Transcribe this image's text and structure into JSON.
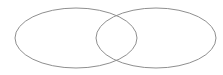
{
  "diagram": {
    "type": "venn",
    "background": "#ffffff",
    "stroke_color": "#8f8f8f",
    "stroke_width": 1,
    "shapes": [
      {
        "name": "left-ellipse",
        "cx": 76,
        "cy": 38,
        "rx": 61,
        "ry": 30
      },
      {
        "name": "right-ellipse",
        "cx": 156,
        "cy": 38,
        "rx": 60,
        "ry": 30
      }
    ]
  }
}
